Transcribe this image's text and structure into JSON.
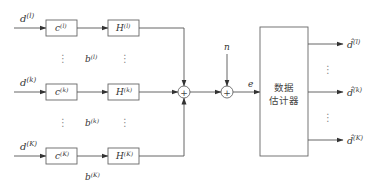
{
  "diagram": {
    "inputs": [
      {
        "id": "top",
        "base": "d",
        "sup": "(l)"
      },
      {
        "id": "mid",
        "base": "d",
        "sup": "(k)"
      },
      {
        "id": "bot",
        "base": "d",
        "sup": "(K)"
      }
    ],
    "c_blocks": [
      {
        "base": "c",
        "sup": "(l)"
      },
      {
        "base": "c",
        "sup": "(k)"
      },
      {
        "base": "c",
        "sup": "(K)"
      }
    ],
    "h_blocks": [
      {
        "base": "H",
        "sup": "(l)"
      },
      {
        "base": "H",
        "sup": "(k)"
      },
      {
        "base": "H",
        "sup": "(K)"
      }
    ],
    "b_labels": [
      {
        "base": "b",
        "sup": "(l)"
      },
      {
        "base": "b",
        "sup": "(k)"
      },
      {
        "base": "b",
        "sup": "(K)"
      }
    ],
    "summer_symbol": "+",
    "noise_label": "n",
    "signal_label": "e",
    "estimator": {
      "line1": "数据",
      "line2": "估计器"
    },
    "outputs": [
      {
        "base": "d̂",
        "sup": "(l)"
      },
      {
        "base": "d̂",
        "sup": "(k)"
      },
      {
        "base": "d̂",
        "sup": "(K)"
      }
    ],
    "ellipsis": "⋮"
  }
}
